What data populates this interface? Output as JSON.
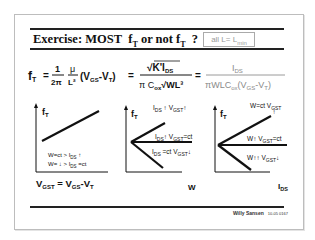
{
  "slide": {
    "title_prefix": "Exercise: MOST",
    "title_ft1": "f",
    "title_ft1_sub": "T",
    "title_mid": "or not",
    "title_ft2": "f",
    "title_ft2_sub": "T",
    "title_q": "?",
    "condition_main": "all L= L",
    "condition_sub": "min"
  },
  "formula": {
    "lhs": "f",
    "lhs_sub": "T",
    "eq": "=",
    "frac1_num": "1",
    "frac1_den": "2π",
    "frac2_num": "μ",
    "frac2_den": "L²",
    "vgs_term": "(V",
    "vgs_sub": "GS",
    "vt_term": "-V",
    "vt_sub": "T",
    "close": ")",
    "frac3_num": "√K'I",
    "frac3_num_sub": "DS",
    "frac3_den": "π C",
    "frac3_den_sub": "ox",
    "frac3_den_root": "√WL³",
    "frac4_num": "I",
    "frac4_num_sub": "DS",
    "frac4_den": "πWLC",
    "frac4_den_sub": "ox",
    "frac4_den_rest": "(V",
    "frac4_den_gs": "GS",
    "frac4_den_vt": "-V",
    "frac4_den_t": "T",
    "frac4_den_close": ")"
  },
  "graphs": [
    {
      "ylabel": "f",
      "ylabel_sub": "T",
      "xlabel": "V",
      "xlabel_sub": "GST",
      "xlabel_rest": " = V",
      "xlabel_gs": "GS",
      "xlabel_vt": "-V",
      "xlabel_t": "T",
      "note1": "W=ct  >  I",
      "note1_sub": "DS",
      "note1_arrow": " ↑",
      "note2": "W= ↓  >  I",
      "note2_sub": "DS",
      "note2_rest": " =ct"
    },
    {
      "ylabel": "f",
      "ylabel_sub": "T",
      "xlabel": "W",
      "lines": [
        {
          "label": "I",
          "sub": "DS",
          "rest": " ↑ V",
          "sub2": "GST",
          "rest2": "↑"
        },
        {
          "label": "I",
          "sub": "DS",
          "rest": "↑ V",
          "sub2": "GST",
          "rest2": "=ct"
        },
        {
          "label": "I",
          "sub": "DS",
          "rest": " =ct  V",
          "sub2": "GST",
          "rest2": "↓"
        }
      ]
    },
    {
      "ylabel": "f",
      "ylabel_sub": "T",
      "xlabel": "I",
      "xlabel_sub": "DS",
      "lines": [
        {
          "label": "W=ct  V",
          "sub": "GST",
          "rest": "↑"
        },
        {
          "label": "W↑ V",
          "sub": "GST",
          "rest": "=ct"
        },
        {
          "label": "W↑↑ V",
          "sub": "GST",
          "rest": "↓"
        }
      ]
    }
  ],
  "footer": {
    "author": "Willy Sansen",
    "code": "10-05 0167"
  }
}
